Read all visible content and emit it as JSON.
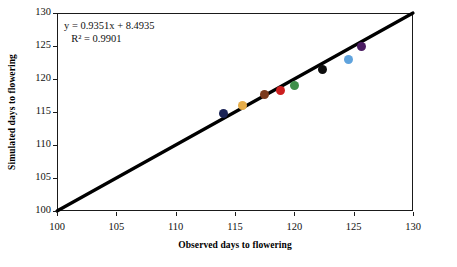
{
  "chart_data": {
    "type": "scatter",
    "title": "",
    "xlabel": "Observed days to flowering",
    "ylabel": "Simulated days to flowering",
    "xlim": [
      100,
      130
    ],
    "ylim": [
      100,
      130
    ],
    "xticks": [
      100,
      105,
      110,
      115,
      120,
      125,
      130
    ],
    "yticks": [
      100,
      105,
      110,
      115,
      120,
      125,
      130
    ],
    "grid": false,
    "legend": "none",
    "annotations": {
      "equation": "y = 0.9351x + 8.4935",
      "r_squared": "R² = 0.9901",
      "slope": 0.9351,
      "intercept": 8.4935,
      "r2_value": 0.9901
    },
    "reference_line": {
      "type": "1:1 line",
      "x": [
        100,
        130
      ],
      "y": [
        100,
        130
      ],
      "color": "#000000"
    },
    "points": [
      {
        "x": 114.0,
        "y": 114.8,
        "color": "#1b2456",
        "name": "point-navy"
      },
      {
        "x": 115.6,
        "y": 116.0,
        "color": "#e6ad4a",
        "name": "point-tan"
      },
      {
        "x": 117.5,
        "y": 117.6,
        "color": "#7b3a1c",
        "name": "point-brown"
      },
      {
        "x": 118.8,
        "y": 118.3,
        "color": "#cc1f1f",
        "name": "point-red"
      },
      {
        "x": 120.0,
        "y": 119.0,
        "color": "#3f8f4a",
        "name": "point-green"
      },
      {
        "x": 122.4,
        "y": 121.5,
        "color": "#0d0d0d",
        "name": "point-black"
      },
      {
        "x": 124.6,
        "y": 123.0,
        "color": "#5fa3dd",
        "name": "point-lightblue"
      },
      {
        "x": 125.7,
        "y": 125.0,
        "color": "#4b1c62",
        "name": "point-purple"
      }
    ]
  }
}
